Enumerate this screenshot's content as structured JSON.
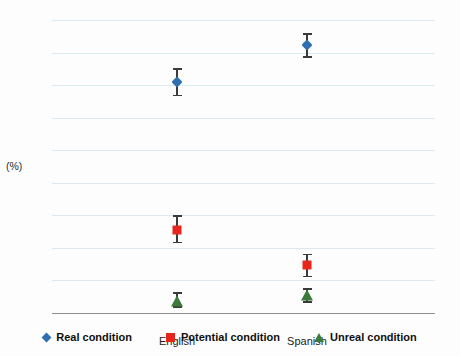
{
  "chart_data": {
    "type": "scatter",
    "title": "",
    "xlabel": "",
    "ylabel": "(%)",
    "categories": [
      "English",
      "Spanish"
    ],
    "ylim": [
      0,
      90
    ],
    "yticks": [
      0,
      10,
      20,
      30,
      40,
      50,
      60,
      70,
      80,
      90
    ],
    "grid": true,
    "legend_position": "bottom",
    "errorbars": "shown",
    "series": [
      {
        "name": "Real condition",
        "marker": "diamond",
        "color": "#2f6fad",
        "values": [
          71.0,
          82.3
        ],
        "err_low": [
          67.0,
          78.8
        ],
        "err_high": [
          75.2,
          86.0
        ]
      },
      {
        "name": "Potential condition",
        "marker": "square",
        "color": "#e8251c",
        "values": [
          25.6,
          14.6
        ],
        "err_low": [
          21.9,
          11.4
        ],
        "err_high": [
          30.1,
          18.2
        ]
      },
      {
        "name": "Unreal condition",
        "marker": "triangle",
        "color": "#3c7a3c",
        "values": [
          3.4,
          5.2
        ],
        "err_low": [
          2.0,
          3.6
        ],
        "err_high": [
          6.3,
          7.6
        ]
      }
    ]
  },
  "axis": {
    "y_labels": [
      "90",
      "80",
      "70",
      "60",
      "50",
      "40",
      "30",
      "20",
      "10",
      "0"
    ],
    "y_unit_label": "(%)",
    "x_labels": [
      "English",
      "Spanish"
    ]
  },
  "legend": {
    "items": [
      {
        "label": "Real condition",
        "color": "#2f6fad",
        "icon": "diamond-marker-icon"
      },
      {
        "label": "Potential condition",
        "color": "#e8251c",
        "icon": "square-marker-icon"
      },
      {
        "label": "Unreal condition",
        "color": "#3c7a3c",
        "icon": "triangle-marker-icon"
      }
    ]
  },
  "colors": {
    "gridline": "#dbe9f2",
    "axis": "#8d8d8d",
    "errorbar": "#3b3b3b",
    "background": "#fdfdfd"
  }
}
